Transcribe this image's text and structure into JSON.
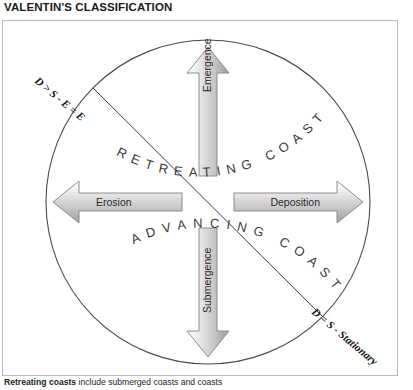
{
  "page": {
    "title": "VALENTIN'S CLASSIFICATION"
  },
  "diagram": {
    "arc_top_label": "ADVANCING COAST",
    "arc_bottom_label": "RETREATING COAST",
    "arrows": {
      "up": "Emergence",
      "down": "Submergence",
      "left": "Erosion",
      "right": "Deposition"
    },
    "annotations": {
      "upper_left": "D > S - E = E",
      "lower_right": "D = S - Stationary"
    },
    "colors": {
      "arrow_fill_light": "#f4f4f4",
      "arrow_fill_dark": "#9a9a9a",
      "arrow_stroke": "#8c8c8c",
      "circle_stroke": "#4a4a4a",
      "frame_border": "#b9b9b9",
      "text": "#2a2a2a"
    }
  },
  "caption": {
    "lead": "Retreating coasts",
    "rest": " include submerged coasts and coasts"
  }
}
